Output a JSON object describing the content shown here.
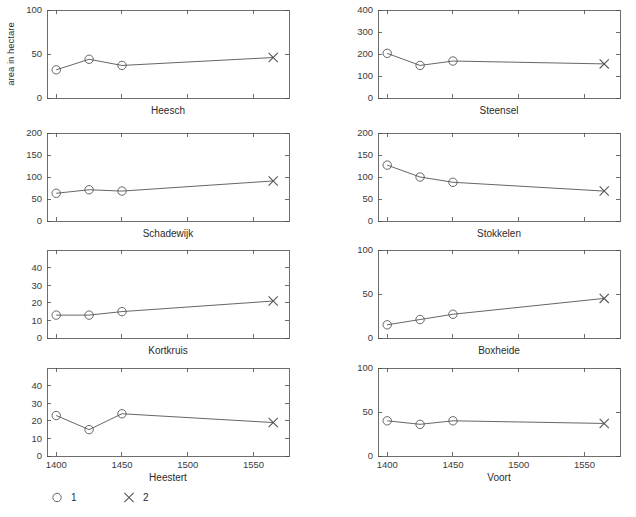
{
  "figure": {
    "width": 636,
    "height": 517,
    "background": "#ffffff",
    "line_color": "#555555",
    "axis_color": "#4a4a4a",
    "y_axis_label": "area in hectare"
  },
  "legend": {
    "position": "bottom-left",
    "entries": [
      {
        "marker": "circle-marker",
        "label": "1"
      },
      {
        "marker": "cross-marker",
        "label": "2"
      }
    ]
  },
  "chart_data": {
    "type": "line",
    "title": "",
    "xlabel": "",
    "ylabel": "area in hectare",
    "grid": false,
    "xlim": [
      1393,
      1577
    ],
    "x": [
      1400,
      1425,
      1450,
      1565
    ],
    "series_markers": {
      "1": "circle",
      "2": "cross"
    },
    "marker_assignment": [
      "1",
      "1",
      "1",
      "2"
    ],
    "xticks": [
      1400,
      1450,
      1500,
      1550
    ],
    "xticklabels": [
      "1400",
      "1450",
      "1500",
      "1550"
    ],
    "panels": [
      {
        "name": "Heesch",
        "row": 0,
        "col": 0,
        "ylim": [
          0,
          100
        ],
        "yticks": [
          0,
          50,
          100
        ],
        "yticklabels": [
          "0",
          "50",
          "100"
        ],
        "values": [
          32,
          44,
          37,
          46
        ],
        "show_xticklabels": false
      },
      {
        "name": "Steensel",
        "row": 0,
        "col": 1,
        "ylim": [
          0,
          400
        ],
        "yticks": [
          0,
          100,
          200,
          300,
          400
        ],
        "yticklabels": [
          "0",
          "100",
          "200",
          "300",
          "400"
        ],
        "values": [
          203,
          148,
          168,
          155
        ],
        "show_xticklabels": false
      },
      {
        "name": "Schadewijk",
        "row": 1,
        "col": 0,
        "ylim": [
          0,
          200
        ],
        "yticks": [
          0,
          50,
          100,
          150,
          200
        ],
        "yticklabels": [
          "0",
          "50",
          "100",
          "150",
          "200"
        ],
        "values": [
          63,
          71,
          68,
          91
        ],
        "show_xticklabels": false
      },
      {
        "name": "Stokkelen",
        "row": 1,
        "col": 1,
        "ylim": [
          0,
          200
        ],
        "yticks": [
          0,
          50,
          100,
          150,
          200
        ],
        "yticklabels": [
          "0",
          "50",
          "100",
          "150",
          "200"
        ],
        "values": [
          127,
          100,
          88,
          68
        ],
        "show_xticklabels": false
      },
      {
        "name": "Kortkruis",
        "row": 2,
        "col": 0,
        "ylim": [
          0,
          50
        ],
        "yticks": [
          0,
          10,
          20,
          30,
          40
        ],
        "yticklabels": [
          "0",
          "10",
          "20",
          "30",
          "40"
        ],
        "values": [
          13,
          13,
          15,
          21
        ],
        "show_xticklabels": false
      },
      {
        "name": "Boxheide",
        "row": 2,
        "col": 1,
        "ylim": [
          0,
          100
        ],
        "yticks": [
          0,
          50,
          100
        ],
        "yticklabels": [
          "0",
          "50",
          "100"
        ],
        "values": [
          15,
          21,
          27,
          45
        ],
        "show_xticklabels": false
      },
      {
        "name": "Heestert",
        "row": 3,
        "col": 0,
        "ylim": [
          0,
          50
        ],
        "yticks": [
          0,
          10,
          20,
          30,
          40
        ],
        "yticklabels": [
          "0",
          "10",
          "20",
          "30",
          "40"
        ],
        "values": [
          23,
          15,
          24,
          19
        ],
        "show_xticklabels": true
      },
      {
        "name": "Voort",
        "row": 3,
        "col": 1,
        "ylim": [
          0,
          100
        ],
        "yticks": [
          0,
          50,
          100
        ],
        "yticklabels": [
          "0",
          "50",
          "100"
        ],
        "values": [
          40,
          36,
          40,
          37
        ],
        "show_xticklabels": true
      }
    ]
  }
}
